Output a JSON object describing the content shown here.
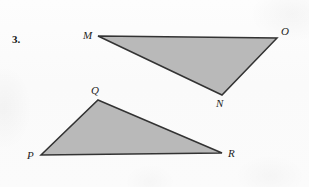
{
  "page": {
    "problem_number": "3.",
    "background_color": "#fbfbfb",
    "width": 309,
    "height": 187
  },
  "style": {
    "fill_color": "#b9b9b9",
    "stroke_color": "#333333",
    "stroke_width": 1.5,
    "label_color": "#1e1e1e"
  },
  "figures": [
    {
      "name": "triangle-mno",
      "type": "triangle",
      "vertices": [
        {
          "label": "M",
          "x": 98,
          "y": 36,
          "label_x": 83,
          "label_y": 30
        },
        {
          "label": "O",
          "x": 277,
          "y": 38,
          "label_x": 281,
          "label_y": 26
        },
        {
          "label": "N",
          "x": 222,
          "y": 95,
          "label_x": 216,
          "label_y": 98
        }
      ],
      "points": "98,36 277,38 222,95"
    },
    {
      "name": "triangle-pqr",
      "type": "triangle",
      "vertices": [
        {
          "label": "Q",
          "x": 98,
          "y": 100,
          "label_x": 91,
          "label_y": 85
        },
        {
          "label": "P",
          "x": 41,
          "y": 155,
          "label_x": 27,
          "label_y": 150
        },
        {
          "label": "R",
          "x": 222,
          "y": 153,
          "label_x": 228,
          "label_y": 148
        }
      ],
      "points": "98,100 222,153 41,155"
    }
  ]
}
